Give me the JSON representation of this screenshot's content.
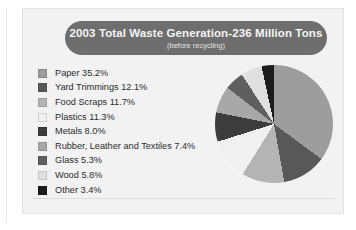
{
  "title": {
    "main": "2003 Total Waste Generation-236 Million Tons",
    "sub": "(before recycling)"
  },
  "chart_data": {
    "type": "pie",
    "title": "2003 Total Waste Generation-236 Million Tons",
    "subtitle": "(before recycling)",
    "total_label": "236 Million Tons",
    "units": "percent",
    "start_angle_deg": 0,
    "direction": "clockwise",
    "legend_position": "left",
    "grid": false,
    "categories": [
      "Paper",
      "Yard Trimmings",
      "Food Scraps",
      "Plastics",
      "Metals",
      "Rubber, Leather and Textiles",
      "Glass",
      "Wood",
      "Other"
    ],
    "values": [
      35.2,
      12.1,
      11.7,
      11.3,
      8.0,
      7.4,
      5.3,
      5.8,
      3.4
    ],
    "colors": [
      "#9d9d9d",
      "#585858",
      "#b4b4b4",
      "#f0f0f0",
      "#3c3c3c",
      "#a8a8a8",
      "#5f5f5f",
      "#e0e0e0",
      "#1c1c1c"
    ],
    "labels": [
      "Paper 35.2%",
      "Yard Trimmings 12.1%",
      "Food Scraps 11.7%",
      "Plastics 11.3%",
      "Metals 8.0%",
      "Rubber, Leather and Textiles 7.4%",
      "Glass 5.3%",
      "Wood 5.8%",
      "Other 3.4%"
    ]
  }
}
